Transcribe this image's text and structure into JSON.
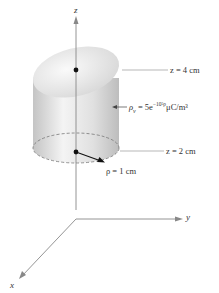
{
  "diagram": {
    "axes": {
      "z_label": "z",
      "y_label": "y",
      "x_label": "x"
    },
    "labels": {
      "top_plane": "z = 4  cm",
      "charge_density_symbol": "ρ",
      "charge_density_subscript": "v",
      "charge_density_expr_prefix": " = 5e",
      "charge_density_exponent": "−10⁵ρ",
      "charge_density_units": "μC/m³",
      "bottom_plane": "z = 2  cm",
      "radius": "ρ = 1 cm"
    },
    "colors": {
      "axis": "#888888",
      "cylinder_light": "#f2f2f2",
      "cylinder_dark": "#c8c8c8",
      "text": "#333333"
    }
  }
}
